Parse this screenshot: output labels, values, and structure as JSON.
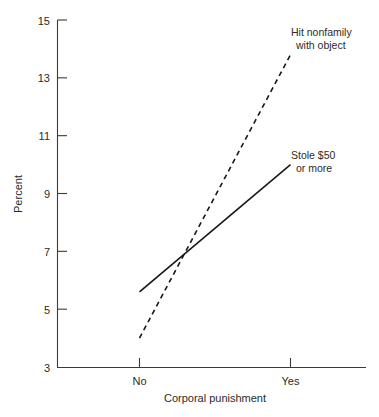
{
  "chart_data": {
    "type": "line",
    "title": "",
    "subtitle": "",
    "xlabel": "Corporal punishment",
    "ylabel": "Percent",
    "categories": [
      "No",
      "Yes"
    ],
    "x": [
      0,
      1
    ],
    "xlim": [
      -0.3,
      1.3
    ],
    "ylim": [
      3,
      15
    ],
    "yticks": [
      3,
      5,
      7,
      9,
      11,
      13,
      15
    ],
    "ytick_labels": [
      "3",
      "5",
      "7",
      "9",
      "11",
      "13",
      "15"
    ],
    "xtick_labels": [
      "No",
      "Yes"
    ],
    "grid": false,
    "legend_position": "inline-right-end-of-line",
    "series": [
      {
        "name": "Hit nonfamily with object",
        "label_line1": "Hit nonfamily",
        "label_line2": "with object",
        "style": "dashed",
        "color": "#171717",
        "values": [
          4.0,
          13.8
        ]
      },
      {
        "name": "Stole $50 or more",
        "label_line1": "Stole $50",
        "label_line2": "or more",
        "style": "solid",
        "color": "#171717",
        "values": [
          5.6,
          10.0
        ]
      }
    ],
    "annotations": [
      {
        "text": "lines intersect near 7 percent",
        "value": 7.0
      }
    ]
  },
  "axis": {
    "y_label": "Percent",
    "x_label": "Corporal punishment",
    "y_ticks": [
      "15",
      "13",
      "11",
      "9",
      "7",
      "5",
      "3"
    ],
    "x_ticks": [
      "No",
      "Yes"
    ]
  },
  "labels": {
    "series_a_line1": "Hit nonfamily",
    "series_a_line2": "with object",
    "series_b_line1": "Stole $50",
    "series_b_line2": "or more"
  },
  "colors": {
    "background": "#ffffff",
    "ink": "#171717",
    "axis": "#3a3a3a"
  }
}
